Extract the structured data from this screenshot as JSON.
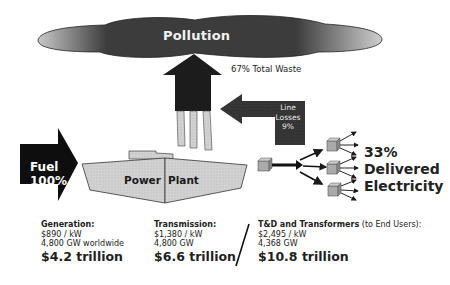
{
  "cloud": {
    "label": "Pollution",
    "color": "#3a3a3a"
  },
  "waste": {
    "label": "67% Total Waste"
  },
  "line_losses": {
    "line1": "Line",
    "line2": "Losses",
    "line3": "9%"
  },
  "fuel": {
    "line1": "Fuel",
    "line2": "100%"
  },
  "plant": {
    "word1": "Power",
    "word2": "Plant"
  },
  "delivered": {
    "line1": "33%",
    "line2": "Delivered",
    "line3": "Electricity"
  },
  "costs": [
    {
      "heading": "Generation:",
      "heading_sub": "",
      "rate": "$890 / kW",
      "capacity": "4,800 GW worldwide",
      "total": "$4.2 trillion"
    },
    {
      "heading": "Transmission:",
      "heading_sub": "",
      "rate": "$1,380 / kW",
      "capacity": "4,800 GW",
      "total": "$6.6 trillion"
    },
    {
      "heading": "T&D and Transformers",
      "heading_sub": " (to End Users):",
      "rate": "$2,495 / kW",
      "capacity": "4,368 GW",
      "total": "$10.8 trillion"
    }
  ]
}
